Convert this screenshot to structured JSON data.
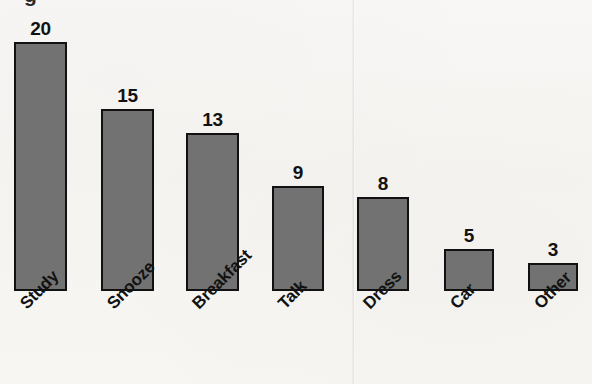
{
  "chart_data": {
    "type": "bar",
    "title": "",
    "xlabel": "",
    "ylabel": "",
    "ylim": [
      0,
      20
    ],
    "grid": false,
    "legend": "none",
    "orientation": "vertical",
    "bar_color": "#727272",
    "bar_edge_color": "#111111",
    "background_color": "#f7f6f3",
    "label_rotation_degrees": -45,
    "categories": [
      "Study",
      "Snooze",
      "Breakfast",
      "Talk",
      "Dress",
      "Car",
      "Other"
    ],
    "values": [
      20,
      15,
      13,
      9,
      8,
      5,
      3
    ],
    "value_labels": [
      "20",
      "15",
      "13",
      "9",
      "8",
      "5",
      "3"
    ],
    "bars": [
      {
        "category": "Study",
        "value": 20,
        "label": "20",
        "x": 14,
        "width": 53,
        "top": 42,
        "value_label_x": 14,
        "value_label_y": 19,
        "cat_label_x": 17,
        "cat_label_y": 300
      },
      {
        "category": "Snooze",
        "value": 15,
        "label": "15",
        "x": 101,
        "width": 53,
        "top": 109,
        "value_label_x": 101,
        "value_label_y": 86,
        "cat_label_x": 104,
        "cat_label_y": 300
      },
      {
        "category": "Breakfast",
        "value": 13,
        "label": "13",
        "x": 186,
        "width": 53,
        "top": 133,
        "value_label_x": 186,
        "value_label_y": 110,
        "cat_label_x": 189,
        "cat_label_y": 300
      },
      {
        "category": "Talk",
        "value": 9,
        "label": "9",
        "x": 272,
        "width": 52,
        "top": 186,
        "value_label_x": 272,
        "value_label_y": 163,
        "cat_label_x": 275,
        "cat_label_y": 300
      },
      {
        "category": "Dress",
        "value": 8,
        "label": "8",
        "x": 357,
        "width": 52,
        "top": 197,
        "value_label_x": 357,
        "value_label_y": 174,
        "cat_label_x": 360,
        "cat_label_y": 300
      },
      {
        "category": "Car",
        "value": 5,
        "label": "5",
        "x": 444,
        "width": 50,
        "top": 249,
        "value_label_x": 444,
        "value_label_y": 226,
        "cat_label_x": 447,
        "cat_label_y": 300
      },
      {
        "category": "Other",
        "value": 3,
        "label": "3",
        "x": 528,
        "width": 50,
        "top": 263,
        "value_label_x": 528,
        "value_label_y": 240,
        "cat_label_x": 531,
        "cat_label_y": 300
      }
    ],
    "baseline_y": 291
  },
  "artifacts": {
    "title_remnant_text": "g",
    "seam_present": true
  }
}
